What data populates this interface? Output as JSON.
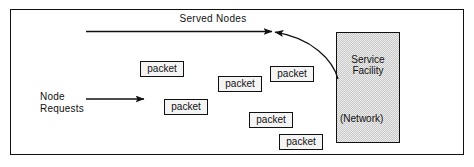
{
  "figure": {
    "name": "packet-switching-network-diagram",
    "frame": {
      "x": 10,
      "y": 9,
      "width": 454,
      "height": 146
    },
    "border_color": "#111111",
    "background_color": "#ffffff"
  },
  "labels": {
    "served_nodes": "Served Nodes",
    "node_requests": "Node\nRequests"
  },
  "service_facility": {
    "title": "Service\nFacility",
    "subtitle": "(Network)",
    "fill_color": "#ececec",
    "border_color": "#111111",
    "x": 336,
    "y": 32,
    "width": 64,
    "height": 111
  },
  "packets": [
    {
      "label": "packet",
      "x": 140,
      "y": 61,
      "width": 44,
      "height": 16
    },
    {
      "label": "packet",
      "x": 218,
      "y": 76,
      "width": 44,
      "height": 16
    },
    {
      "label": "packet",
      "x": 270,
      "y": 66,
      "width": 44,
      "height": 16
    },
    {
      "label": "packet",
      "x": 164,
      "y": 99,
      "width": 44,
      "height": 16
    },
    {
      "label": "packet",
      "x": 249,
      "y": 112,
      "width": 44,
      "height": 16
    },
    {
      "label": "packet",
      "x": 279,
      "y": 134,
      "width": 44,
      "height": 16
    }
  ],
  "arrows": [
    {
      "name": "served-nodes-arrow",
      "type": "line",
      "from": {
        "x": 272,
        "y": 31.5
      },
      "to": {
        "x": 84,
        "y": 31.5
      },
      "head_at": "to",
      "color": "#111111"
    },
    {
      "name": "service-facility-return-curve",
      "type": "curve",
      "from": {
        "x": 338,
        "y": 79
      },
      "to": {
        "x": 272,
        "y": 31.5
      },
      "head_at": "to",
      "color": "#111111"
    },
    {
      "name": "node-requests-arrow",
      "type": "line",
      "from": {
        "x": 86,
        "y": 99
      },
      "to": {
        "x": 144,
        "y": 99
      },
      "head_at": "to",
      "color": "#111111"
    }
  ]
}
